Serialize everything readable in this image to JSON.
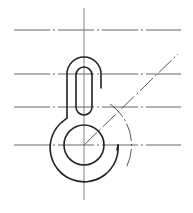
{
  "drawing": {
    "title": "",
    "type": "technical-construction-drawing",
    "subject": "hook-shaped part with slot and ring",
    "colors": {
      "background": "#ffffff",
      "outline": "#222222",
      "centerline": "#555555"
    },
    "centerlines": {
      "vertical_x": 84,
      "horizontal_y": [
        30,
        74,
        107,
        145
      ]
    },
    "features": [
      {
        "name": "slot",
        "description": "vertical obround slot"
      },
      {
        "name": "outer-hook",
        "description": "hook-shaped outer contour around slot"
      },
      {
        "name": "inner-circle",
        "description": "circular hole centered on lowest centerline"
      },
      {
        "name": "outer-ring-arc",
        "description": "large arc around circle ending in a short tick"
      },
      {
        "name": "construction-arc",
        "description": "dash-dot arc to the right"
      },
      {
        "name": "construction-diagonal",
        "description": "dash-dot diagonal line from circle center"
      }
    ]
  }
}
